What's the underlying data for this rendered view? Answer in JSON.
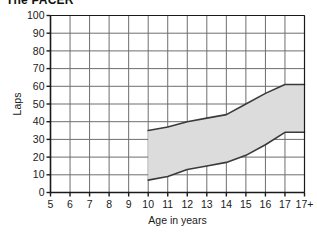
{
  "title": "The PACER",
  "chart_data": {
    "type": "area",
    "title": "The PACER",
    "xlabel": "Age in years",
    "ylabel": "Laps",
    "categories": [
      "5",
      "6",
      "7",
      "8",
      "9",
      "10",
      "11",
      "12",
      "13",
      "14",
      "15",
      "16",
      "17",
      "17+"
    ],
    "x_tick_labels": [
      "5",
      "6",
      "7",
      "8",
      "9",
      "10",
      "11",
      "12",
      "13",
      "14",
      "15",
      "16",
      "17",
      "17+"
    ],
    "y_tick_labels": [
      "0",
      "10",
      "20",
      "30",
      "40",
      "50",
      "60",
      "70",
      "80",
      "90",
      "100"
    ],
    "ylim": [
      0,
      100
    ],
    "y_step": 10,
    "grid": true,
    "legend": "none",
    "band_fill_color": "#dcdcdc",
    "band_line_color": "#3a3a3a",
    "grid_color": "#6e6e6e",
    "axis_color": "#1a1a1a",
    "series": [
      {
        "name": "Upper bound",
        "x": [
          "10",
          "11",
          "12",
          "13",
          "14",
          "15",
          "16",
          "17",
          "17+"
        ],
        "values": [
          35,
          37,
          40,
          42,
          44,
          50,
          56,
          61,
          61
        ]
      },
      {
        "name": "Lower bound",
        "x": [
          "10",
          "11",
          "12",
          "13",
          "14",
          "15",
          "16",
          "17",
          "17+"
        ],
        "values": [
          7,
          9,
          13,
          15,
          17,
          21,
          27,
          34,
          34
        ]
      }
    ],
    "band_start_category": "10",
    "band_end_category": "17+"
  }
}
